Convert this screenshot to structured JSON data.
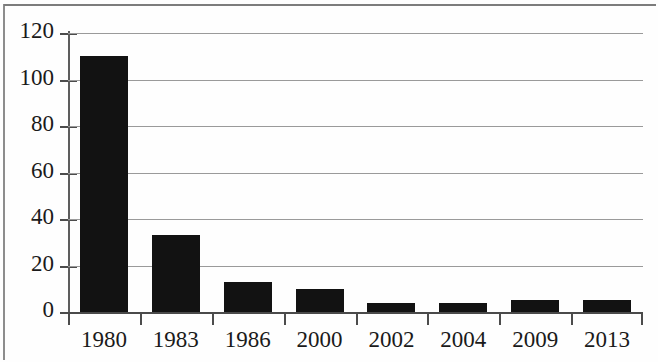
{
  "chart_data": {
    "type": "bar",
    "title": "",
    "subtitle": "",
    "xlabel": "",
    "ylabel": "",
    "categories": [
      "1980",
      "1983",
      "1986",
      "2000",
      "2002",
      "2004",
      "2009",
      "2013"
    ],
    "values": [
      110,
      33,
      13,
      10,
      4,
      4,
      5,
      5
    ],
    "series": [
      {
        "name": "",
        "values": [
          110,
          33,
          13,
          10,
          4,
          4,
          5,
          5
        ]
      }
    ],
    "ylim": [
      0,
      120
    ],
    "ytick_labels": [
      "0",
      "20",
      "40",
      "60",
      "80",
      "100",
      "120"
    ],
    "ytick_values": [
      0,
      20,
      40,
      60,
      80,
      100,
      120
    ],
    "grid": true,
    "grid_axis": "y",
    "legend": false,
    "legend_position": "none",
    "bar_color": "#121212",
    "grid_color": "#9a9a9a",
    "axis_color": "#4c4c4c",
    "text_color": "#1a1a1a",
    "background_color": "#fefefe",
    "annotations": []
  }
}
